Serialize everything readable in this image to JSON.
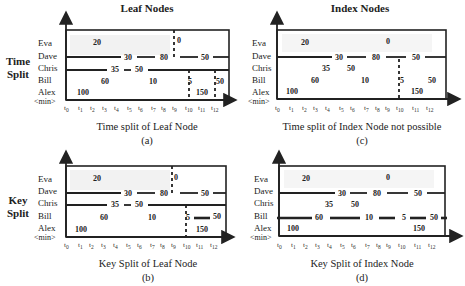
{
  "columns": {
    "left": "Leaf Nodes",
    "right": "Index Nodes"
  },
  "rows_titles": {
    "top": [
      "Time",
      "Split"
    ],
    "bottom": [
      "Key",
      "Split"
    ]
  },
  "row_labels": [
    "Eva",
    "Dave",
    "Chris",
    "Bill",
    "Alex",
    "<min>"
  ],
  "ticks": [
    "t0",
    "t1",
    "t2",
    "t3",
    "t4",
    "t5",
    "t6",
    "t7",
    "t8",
    "t9",
    "t10",
    "t11",
    "t12"
  ],
  "panels": {
    "a": {
      "caption": "Time split of Leaf Node",
      "letter": "(a)"
    },
    "b": {
      "caption": "Key Split of Leaf Node",
      "letter": "(b)"
    },
    "c": {
      "caption": "Time split of Index Node not possible",
      "letter": "(c)"
    },
    "d": {
      "caption": "Key Split of Index Node",
      "letter": "(d)"
    }
  },
  "values": {
    "eva": [
      "20",
      "0"
    ],
    "dave": [
      "30",
      "80",
      "50"
    ],
    "chris": [
      "35",
      "50"
    ],
    "bill": [
      "60",
      "10",
      "5",
      "50"
    ],
    "alex": [
      "100",
      "150"
    ]
  }
}
